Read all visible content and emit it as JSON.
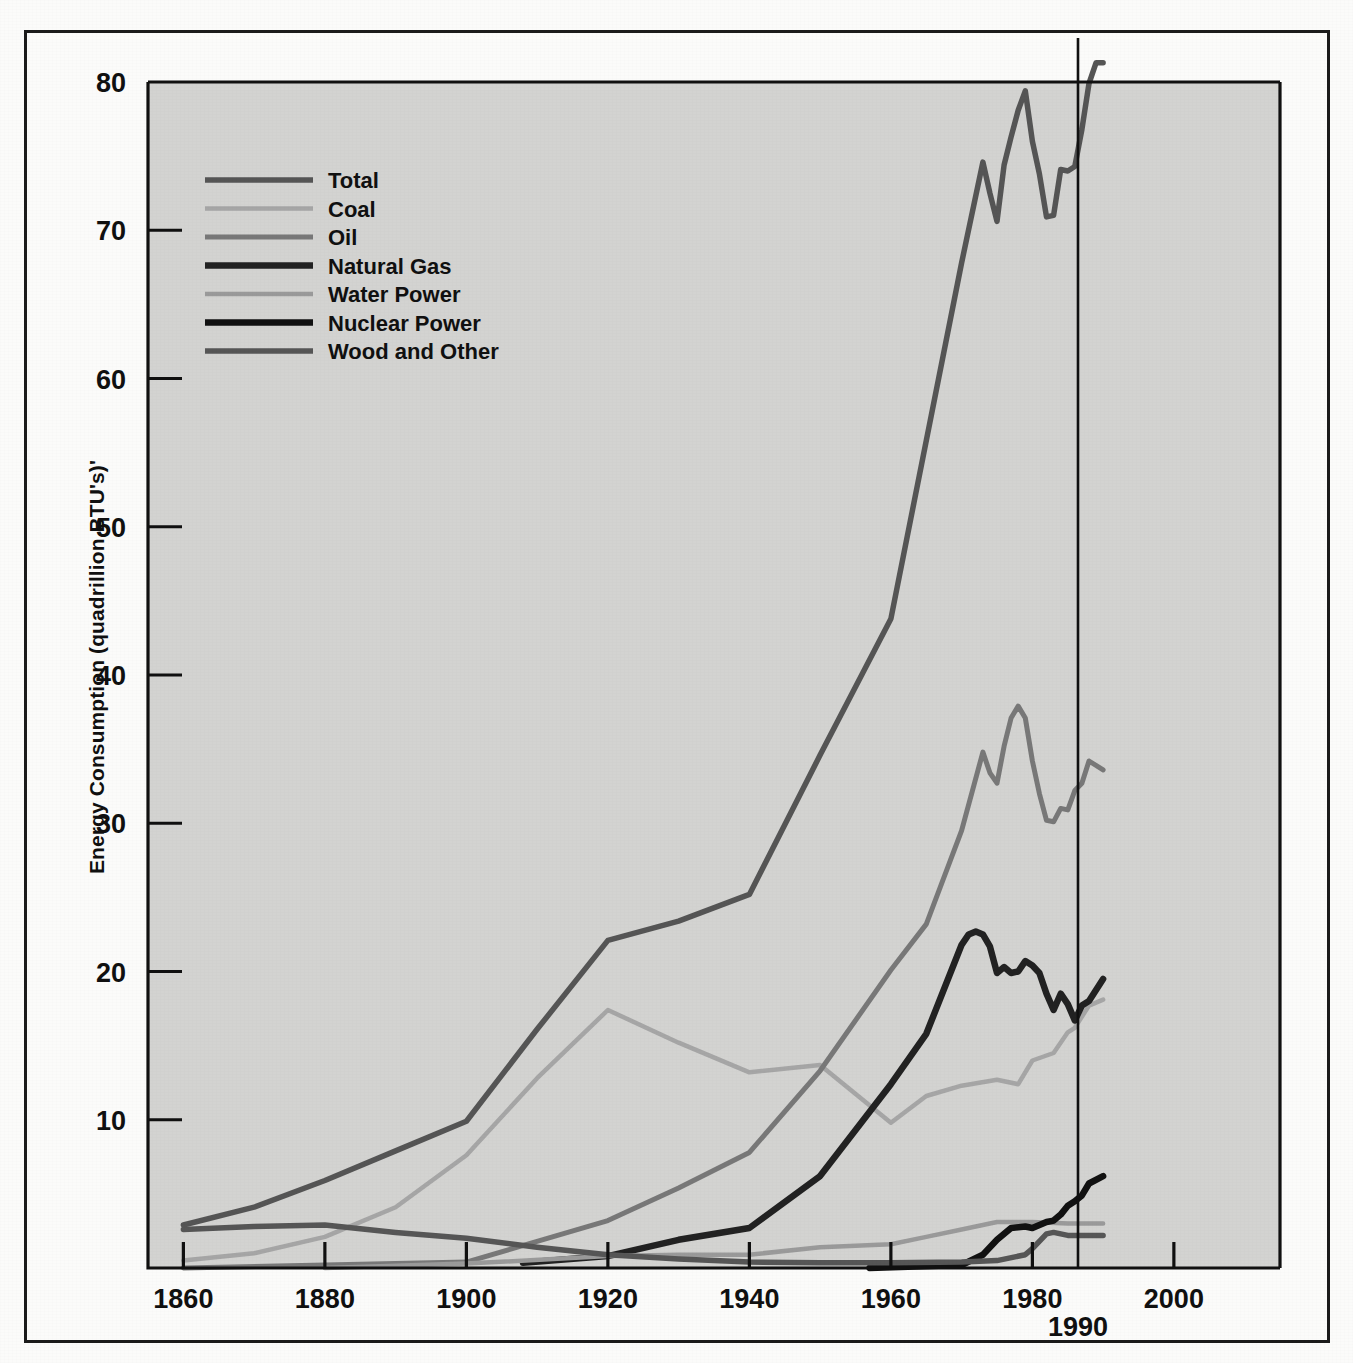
{
  "figure": {
    "background_color": "#fbfbfa",
    "plot_background_color": "#d3d3d1",
    "frame_color": "#1b1b1b"
  },
  "axis": {
    "y_label": "Energy Consumption (quadrillion BTU's)'",
    "y_ticks": [
      "10",
      "20",
      "30",
      "40",
      "50",
      "60",
      "70",
      "80"
    ],
    "x_ticks": [
      "1860",
      "1880",
      "1900",
      "1920",
      "1940",
      "1960",
      "1980",
      "2000"
    ],
    "marker_label": "1990"
  },
  "legend": {
    "items": [
      {
        "label": "Total",
        "color": "#555555",
        "width": 5.5
      },
      {
        "label": "Coal",
        "color": "#a6a6a6",
        "width": 4.5
      },
      {
        "label": "Oil",
        "color": "#787878",
        "width": 5.0
      },
      {
        "label": "Natural Gas",
        "color": "#222222",
        "width": 6.5
      },
      {
        "label": "Water Power",
        "color": "#9a9a9a",
        "width": 4.5
      },
      {
        "label": "Nuclear Power",
        "color": "#111111",
        "width": 6.5
      },
      {
        "label": "Wood and Other",
        "color": "#565656",
        "width": 5.5
      }
    ]
  },
  "chart_data": {
    "type": "line",
    "title": "",
    "xlabel": "",
    "ylabel": "Energy Consumption (quadrillion BTU's)'",
    "xlim": [
      1855,
      2015
    ],
    "ylim": [
      0,
      80
    ],
    "grid": false,
    "legend_position": "upper-left",
    "annotations": [
      {
        "text": "1990",
        "type": "vertical-line",
        "x": 1990
      }
    ],
    "series": [
      {
        "name": "Total",
        "color": "#555555",
        "points": [
          [
            1860,
            2.9
          ],
          [
            1870,
            4.1
          ],
          [
            1880,
            5.9
          ],
          [
            1890,
            7.9
          ],
          [
            1900,
            9.9
          ],
          [
            1910,
            16.1
          ],
          [
            1920,
            22.1
          ],
          [
            1930,
            23.4
          ],
          [
            1940,
            25.2
          ],
          [
            1950,
            34.6
          ],
          [
            1960,
            43.8
          ],
          [
            1970,
            67.8
          ],
          [
            1973,
            74.6
          ],
          [
            1974,
            72.5
          ],
          [
            1975,
            70.6
          ],
          [
            1976,
            74.4
          ],
          [
            1977,
            76.3
          ],
          [
            1978,
            78.1
          ],
          [
            1979,
            79.4
          ],
          [
            1980,
            76.0
          ],
          [
            1981,
            73.8
          ],
          [
            1982,
            70.9
          ],
          [
            1983,
            71.0
          ],
          [
            1984,
            74.1
          ],
          [
            1985,
            74.0
          ],
          [
            1986,
            74.3
          ],
          [
            1987,
            76.8
          ],
          [
            1988,
            79.9
          ],
          [
            1989,
            81.3
          ],
          [
            1990,
            81.3
          ]
        ]
      },
      {
        "name": "Coal",
        "color": "#a6a6a6",
        "points": [
          [
            1860,
            0.5
          ],
          [
            1870,
            1.0
          ],
          [
            1880,
            2.1
          ],
          [
            1890,
            4.1
          ],
          [
            1900,
            7.6
          ],
          [
            1910,
            12.8
          ],
          [
            1920,
            17.4
          ],
          [
            1930,
            15.2
          ],
          [
            1940,
            13.2
          ],
          [
            1950,
            13.7
          ],
          [
            1960,
            9.8
          ],
          [
            1965,
            11.6
          ],
          [
            1970,
            12.3
          ],
          [
            1975,
            12.7
          ],
          [
            1978,
            12.4
          ],
          [
            1980,
            14.0
          ],
          [
            1983,
            14.5
          ],
          [
            1985,
            15.9
          ],
          [
            1986,
            16.2
          ],
          [
            1988,
            17.7
          ],
          [
            1990,
            18.1
          ]
        ]
      },
      {
        "name": "Oil",
        "color": "#787878",
        "points": [
          [
            1860,
            0.0
          ],
          [
            1880,
            0.2
          ],
          [
            1900,
            0.4
          ],
          [
            1910,
            1.8
          ],
          [
            1920,
            3.2
          ],
          [
            1930,
            5.4
          ],
          [
            1940,
            7.8
          ],
          [
            1950,
            13.3
          ],
          [
            1960,
            20.1
          ],
          [
            1965,
            23.2
          ],
          [
            1970,
            29.5
          ],
          [
            1973,
            34.8
          ],
          [
            1974,
            33.4
          ],
          [
            1975,
            32.7
          ],
          [
            1976,
            35.2
          ],
          [
            1977,
            37.1
          ],
          [
            1978,
            37.9
          ],
          [
            1979,
            37.1
          ],
          [
            1980,
            34.2
          ],
          [
            1981,
            32.0
          ],
          [
            1982,
            30.2
          ],
          [
            1983,
            30.1
          ],
          [
            1984,
            31.0
          ],
          [
            1985,
            30.9
          ],
          [
            1986,
            32.2
          ],
          [
            1987,
            32.7
          ],
          [
            1988,
            34.2
          ],
          [
            1990,
            33.6
          ]
        ]
      },
      {
        "name": "Natural Gas",
        "color": "#222222",
        "points": [
          [
            1908,
            0.35
          ],
          [
            1920,
            0.8
          ],
          [
            1930,
            1.9
          ],
          [
            1940,
            2.7
          ],
          [
            1950,
            6.2
          ],
          [
            1960,
            12.4
          ],
          [
            1965,
            15.8
          ],
          [
            1970,
            21.8
          ],
          [
            1971,
            22.5
          ],
          [
            1972,
            22.7
          ],
          [
            1973,
            22.5
          ],
          [
            1974,
            21.7
          ],
          [
            1975,
            19.9
          ],
          [
            1976,
            20.3
          ],
          [
            1977,
            19.9
          ],
          [
            1978,
            20.0
          ],
          [
            1979,
            20.7
          ],
          [
            1980,
            20.4
          ],
          [
            1981,
            19.9
          ],
          [
            1982,
            18.5
          ],
          [
            1983,
            17.4
          ],
          [
            1984,
            18.5
          ],
          [
            1985,
            17.8
          ],
          [
            1986,
            16.7
          ],
          [
            1987,
            17.7
          ],
          [
            1988,
            18.0
          ],
          [
            1990,
            19.5
          ]
        ]
      },
      {
        "name": "Water Power",
        "color": "#9a9a9a",
        "points": [
          [
            1880,
            0.0
          ],
          [
            1900,
            0.3
          ],
          [
            1920,
            0.8
          ],
          [
            1930,
            0.9
          ],
          [
            1940,
            0.9
          ],
          [
            1950,
            1.4
          ],
          [
            1960,
            1.6
          ],
          [
            1965,
            2.1
          ],
          [
            1970,
            2.6
          ],
          [
            1975,
            3.1
          ],
          [
            1980,
            3.1
          ],
          [
            1985,
            3.0
          ],
          [
            1990,
            3.0
          ]
        ]
      },
      {
        "name": "Nuclear Power",
        "color": "#111111",
        "points": [
          [
            1957,
            0.0
          ],
          [
            1970,
            0.2
          ],
          [
            1973,
            0.9
          ],
          [
            1975,
            1.9
          ],
          [
            1977,
            2.7
          ],
          [
            1979,
            2.8
          ],
          [
            1980,
            2.7
          ],
          [
            1982,
            3.1
          ],
          [
            1983,
            3.2
          ],
          [
            1984,
            3.6
          ],
          [
            1985,
            4.2
          ],
          [
            1986,
            4.5
          ],
          [
            1987,
            4.9
          ],
          [
            1988,
            5.7
          ],
          [
            1990,
            6.2
          ]
        ]
      },
      {
        "name": "Wood and Other",
        "color": "#565656",
        "points": [
          [
            1860,
            2.6
          ],
          [
            1870,
            2.8
          ],
          [
            1880,
            2.9
          ],
          [
            1890,
            2.4
          ],
          [
            1900,
            2.0
          ],
          [
            1910,
            1.4
          ],
          [
            1920,
            0.9
          ],
          [
            1930,
            0.6
          ],
          [
            1940,
            0.4
          ],
          [
            1950,
            0.35
          ],
          [
            1960,
            0.35
          ],
          [
            1970,
            0.4
          ],
          [
            1975,
            0.5
          ],
          [
            1979,
            0.9
          ],
          [
            1980,
            1.3
          ],
          [
            1982,
            2.3
          ],
          [
            1983,
            2.4
          ],
          [
            1985,
            2.2
          ],
          [
            1988,
            2.2
          ],
          [
            1990,
            2.2
          ]
        ]
      }
    ]
  }
}
